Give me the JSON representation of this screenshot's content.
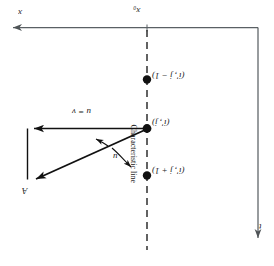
{
  "figure": {
    "page_header": "",
    "axes": {
      "horizontal_label": "x",
      "horizontal_origin_label": "x₀",
      "vertical_label": "t"
    },
    "points": [
      {
        "id": "upper",
        "label": "(i', j − 1)"
      },
      {
        "id": "middle",
        "label": "(i', j)"
      },
      {
        "id": "lower",
        "label": "(i', j + 1)"
      }
    ],
    "vectors": {
      "horizontal_vector_label": "u = v",
      "angle_label": "u",
      "vertex_label": "A"
    },
    "annotations": {
      "characteristic_line": "Characteristic line"
    },
    "colors": {
      "ink": "#1a1a1a",
      "axis": "#555a5e",
      "dashed": "#3a3a3a",
      "paper": "#ffffff"
    }
  }
}
